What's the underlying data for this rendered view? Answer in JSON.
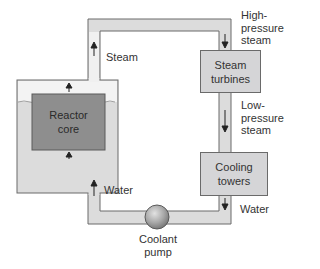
{
  "diagram": {
    "title": "",
    "type": "nuclear power plant coolant loop",
    "components": {
      "reactor_core": {
        "label": "Reactor\ncore"
      },
      "steam_turbines": {
        "label": "Steam\nturbines"
      },
      "cooling_towers": {
        "label": "Cooling\ntowers"
      },
      "coolant_pump": {
        "label": "Coolant\npump"
      }
    },
    "flow_labels": {
      "steam": "Steam",
      "high_pressure_steam": "High-\npressure\nsteam",
      "low_pressure_steam": "Low-\npressure\nsteam",
      "water_right": "Water",
      "water_left": "Water"
    },
    "colors": {
      "pipe_fill": "#dcdcdc",
      "pipe_stroke": "#6a6a6a",
      "core_fill": "#8e8e8e",
      "box_fill": "#d5d5d7",
      "arrow": "#222222",
      "pump_fill": "#a8a8a8"
    }
  }
}
